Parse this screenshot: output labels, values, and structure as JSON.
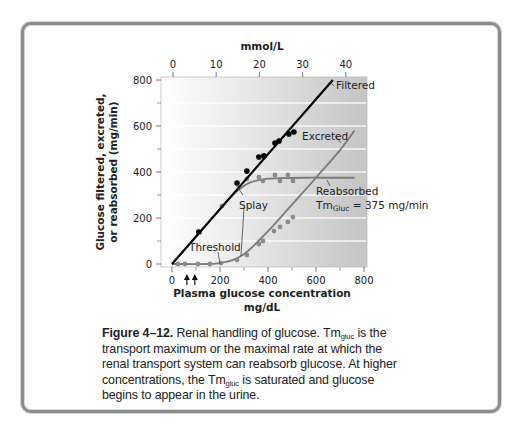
{
  "figure": {
    "label": "Figure 4–12.",
    "caption_parts": {
      "p1": " Renal handling of glucose. Tm",
      "sub1": "gluc",
      "p2": " is the transport maximum or the maximal rate at which the renal transport system can reabsorb glucose. At higher concentrations, the Tm",
      "sub2": "gluc",
      "p3": " is saturated and glucose begins to appear in the urine."
    }
  },
  "chart_data": {
    "type": "line",
    "title": "",
    "xlabel": "Plasma glucose concentration mg/dL",
    "xlabel_line1": "Plasma glucose concentration",
    "xlabel_line2": "mg/dL",
    "ylabel": "Glucose filtered, excreted, or reabsorbed (mg/min)",
    "ylabel_line1": "Glucose filtered, excreted,",
    "ylabel_line2": "or reabsorbed (mg/min)",
    "x2label": "mmol/L",
    "xlim": [
      -40,
      830
    ],
    "ylim": [
      -20,
      820
    ],
    "x_ticks": [
      0,
      200,
      400,
      600,
      800
    ],
    "x_ticks_labels": [
      "0",
      "200",
      "400",
      "600",
      "800"
    ],
    "x_minor_ticks": [
      100,
      300,
      500,
      700
    ],
    "y_ticks": [
      0,
      200,
      400,
      600,
      800
    ],
    "y_ticks_labels": [
      "0",
      "200",
      "400",
      "600",
      "800"
    ],
    "y_minor_ticks": [
      100,
      300,
      500,
      700
    ],
    "x2_ticks_mmol": [
      0,
      10,
      20,
      30,
      40
    ],
    "x2_ticks_labels": [
      "0",
      "10",
      "20",
      "30",
      "40"
    ],
    "grid": "horizontal bands every 100 mg/min",
    "legend": "inline annotations",
    "arrows_at_x": [
      62,
      95
    ],
    "series": [
      {
        "name": "Filtered",
        "style": "line",
        "color": "#000000",
        "x": [
          0,
          670
        ],
        "y": [
          0,
          800
        ]
      },
      {
        "name": "Reabsorbed",
        "style": "curve",
        "color": "#7a7a7a",
        "x": [
          0,
          150,
          220,
          250,
          275,
          300,
          330,
          380,
          450,
          550,
          650,
          760
        ],
        "y": [
          0,
          178,
          262,
          296,
          320,
          340,
          356,
          368,
          373,
          375,
          375,
          375
        ]
      },
      {
        "name": "Excreted",
        "style": "curve",
        "color": "#7a7a7a",
        "x": [
          0,
          150,
          200,
          230,
          260,
          290,
          320,
          360,
          420,
          500,
          600,
          700,
          760
        ],
        "y": [
          0,
          0,
          4,
          10,
          20,
          36,
          60,
          100,
          165,
          258,
          375,
          495,
          580
        ]
      },
      {
        "name": "Filtered (measured)",
        "style": "points",
        "color": "#000000",
        "x": [
          112,
          271,
          312,
          362,
          383,
          429,
          446,
          487,
          508
        ],
        "y": [
          139,
          352,
          404,
          465,
          470,
          526,
          535,
          565,
          574
        ]
      },
      {
        "name": "Reabsorbed (measured)",
        "style": "points",
        "color": "#8a8a8a",
        "x": [
          208,
          312,
          362,
          379,
          429,
          450,
          483,
          504
        ],
        "y": [
          252,
          370,
          378,
          361,
          387,
          361,
          387,
          361
        ]
      },
      {
        "name": "Excreted (measured)",
        "style": "points",
        "color": "#8a8a8a",
        "x": [
          25,
          54,
          108,
          158,
          204,
          271,
          312,
          362,
          379,
          425,
          450,
          483,
          504
        ],
        "y": [
          0,
          0,
          0,
          0,
          4,
          17,
          39,
          87,
          100,
          143,
          161,
          183,
          204
        ]
      }
    ],
    "annotations": [
      {
        "text": "Filtered",
        "near_x": 670,
        "near_y": 800
      },
      {
        "text": "Excreted",
        "near_x": 640,
        "near_y": 590
      },
      {
        "text": "Reabsorbed",
        "near_x": 640,
        "near_y": 340
      },
      {
        "text": "TmGluc = 375 mg/min",
        "near_x": 640,
        "near_y": 290
      },
      {
        "text": "Splay",
        "near_x": 330,
        "near_y": 210
      },
      {
        "text": "Threshold",
        "near_x": 180,
        "near_y": 70
      }
    ]
  },
  "labels": {
    "filtered": "Filtered",
    "excreted": "Excreted",
    "reabsorbed": "Reabsorbed",
    "tm_prefix": "Tm",
    "tm_sub": "Gluc",
    "tm_value": " = 375 mg/min",
    "splay": "Splay",
    "threshold": "Threshold"
  },
  "style": {
    "frame_color": "#8c8c8c",
    "plot_bg_left": "#ffffff",
    "plot_bg_right": "#c4c4c4",
    "filtered_color": "#000000",
    "curve_color": "#7a7a7a"
  }
}
